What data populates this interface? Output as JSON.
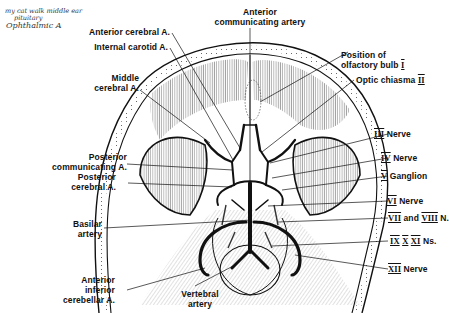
{
  "diagram": {
    "colors": {
      "ink": "#111111",
      "paper": "#ffffff",
      "handwriting": "#333333"
    }
  },
  "handwritten_notes": [
    "my cat walk middle ear",
    "pituitary",
    "Ophthalmic A"
  ],
  "labels": {
    "left": [
      {
        "id": "anterior-cerebral",
        "lines": [
          "Anterior cerebral A."
        ]
      },
      {
        "id": "internal-carotid",
        "lines": [
          "Internal carotid A."
        ]
      },
      {
        "id": "middle-cerebral",
        "lines": [
          "Middle",
          "cerebral A."
        ]
      },
      {
        "id": "posterior-communicating",
        "lines": [
          "Posterior",
          "communicating A."
        ]
      },
      {
        "id": "posterior-cerebral",
        "lines": [
          "Posterior",
          "cerebral A."
        ]
      },
      {
        "id": "basilar",
        "lines": [
          "Basilar",
          "artery"
        ]
      },
      {
        "id": "anterior-inferior-cerebellar",
        "lines": [
          "Anterior",
          "inferior",
          "cerebellar A."
        ]
      }
    ],
    "top": [
      {
        "id": "anterior-communicating",
        "lines": [
          "Anterior",
          "communicating artery"
        ]
      }
    ],
    "bottom": [
      {
        "id": "vertebral",
        "lines": [
          "Vertebral",
          "artery"
        ]
      }
    ],
    "right": [
      {
        "id": "olfactory-bulb",
        "lines": [
          "Position of",
          "olfactory bulb"
        ],
        "numeral": "I"
      },
      {
        "id": "optic-chiasma",
        "text": "Optic chiasma",
        "numeral": "II"
      },
      {
        "id": "nerve-3",
        "numeral": "III",
        "text": "Nerve"
      },
      {
        "id": "nerve-4",
        "numeral": "IV",
        "text": "Nerve"
      },
      {
        "id": "ganglion-5",
        "numeral": "V",
        "text": "Ganglion"
      },
      {
        "id": "nerve-6",
        "numeral": "VI",
        "text": "Nerve"
      },
      {
        "id": "nerve-7-8",
        "numeral": "VII",
        "joiner": "and",
        "numeral2": "VIII",
        "text": "N."
      },
      {
        "id": "nerves-9-10-11",
        "numerals": [
          "IX",
          "X",
          "XI"
        ],
        "text": "Ns."
      },
      {
        "id": "nerve-12",
        "numeral": "XII",
        "text": "Nerve"
      }
    ]
  }
}
